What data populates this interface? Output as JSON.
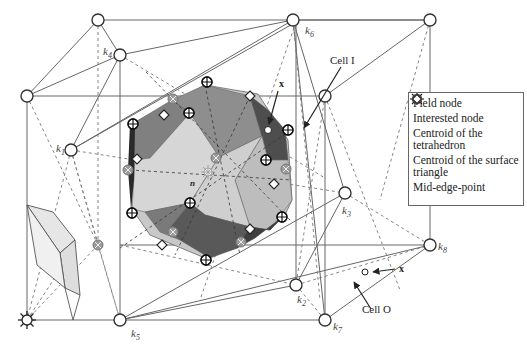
{
  "figure": {
    "type": "3D Voronoi / Delaunay cell diagram",
    "node_labels": {
      "k1": {
        "base": "k",
        "sub": "1"
      },
      "k2": {
        "base": "k",
        "sub": "2"
      },
      "k3": {
        "base": "k",
        "sub": "3"
      },
      "k4": {
        "base": "k",
        "sub": "4"
      },
      "k5": {
        "base": "k",
        "sub": "5"
      },
      "k6": {
        "base": "k",
        "sub": "6"
      },
      "k7": {
        "base": "k",
        "sub": "7"
      },
      "k8": {
        "base": "k",
        "sub": "8"
      }
    },
    "annotations": {
      "cell_inner": "Cell I",
      "cell_outer": "Cell O",
      "point_x_inner": "x",
      "point_x_outer": "x",
      "center_node": "n"
    },
    "colors": {
      "line": "#555555",
      "dark_face": "#5a5a5a",
      "mid_face": "#8c8c8c",
      "light_face": "#c8c8c8",
      "lighter_face": "#dcdcdc",
      "tet_centroid": "#9a9a9a"
    }
  },
  "legend": {
    "items": [
      {
        "icon": "field-node-icon",
        "label": "Field node"
      },
      {
        "icon": "interested-node-icon",
        "label": "Interested node"
      },
      {
        "icon": "tetrahedron-centroid-icon",
        "label": "Centroid of the tetrahedron"
      },
      {
        "icon": "surface-triangle-centroid-icon",
        "label": "Centroid of the surface triangle"
      },
      {
        "icon": "mid-edge-point-icon",
        "label": "Mid-edge-point"
      }
    ]
  }
}
